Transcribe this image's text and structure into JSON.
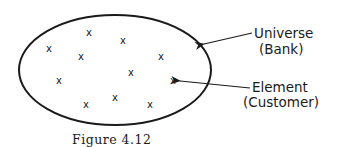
{
  "figure": {
    "caption": "Figure 4.12",
    "universe": {
      "label": "Universe",
      "sublabel": "(Bank)"
    },
    "element": {
      "label": "Element",
      "sublabel": "(Customer)"
    },
    "element_marker": "x",
    "element_count": 11,
    "colors": {
      "stroke": "#1a1a1a",
      "background": "#ffffff"
    }
  }
}
